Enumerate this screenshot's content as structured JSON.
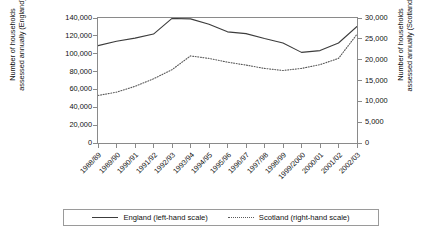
{
  "chart_data": {
    "type": "line",
    "title": "",
    "xlabel": "",
    "categories": [
      "1988/89",
      "1989/90",
      "1990/91",
      "1991/92",
      "1992/93",
      "1993/94",
      "1994/95",
      "1995/96",
      "1996/97",
      "1997/98",
      "1998/99",
      "1999/2000",
      "2000/01",
      "2001/02",
      "2002/03"
    ],
    "grid": false,
    "legend_position": "bottom",
    "axes": {
      "left": {
        "label_line1": "Number of households",
        "label_line2": "assessed annually (England)",
        "ylim": [
          0,
          140000
        ],
        "ticks": [
          0,
          20000,
          40000,
          60000,
          80000,
          100000,
          120000,
          140000
        ],
        "tick_labels": [
          "0",
          "20,000",
          "40,000",
          "60,000",
          "80,000",
          "100,000",
          "120,000",
          "140,000"
        ]
      },
      "right": {
        "label_line1": "Number of households",
        "label_line2": "assessed annually (Scotland)",
        "ylim": [
          0,
          30000
        ],
        "ticks": [
          0,
          5000,
          10000,
          15000,
          20000,
          25000,
          30000
        ],
        "tick_labels": [
          "0",
          "5,000",
          "10,000",
          "15,000",
          "20,000",
          "25,000",
          "30,000"
        ]
      }
    },
    "series": [
      {
        "name": "England (left-hand scale)",
        "axis": "left",
        "style": "solid",
        "color": "#3c3c3c",
        "values": [
          109000,
          114000,
          117500,
          122000,
          139500,
          139000,
          133000,
          124500,
          122500,
          117000,
          112000,
          101500,
          103500,
          112000,
          130500
        ]
      },
      {
        "name": "Scotland (right-hand scale)",
        "axis": "right",
        "style": "dotted",
        "color": "#5a5a5a",
        "values": [
          11400,
          12200,
          13600,
          15400,
          17600,
          20900,
          20300,
          19400,
          18700,
          17900,
          17400,
          17900,
          18800,
          20300,
          26100
        ]
      }
    ]
  },
  "legend": {
    "entries": [
      {
        "label": "England (left-hand scale)",
        "style": "solid"
      },
      {
        "label": "Scotland (right-hand scale)",
        "style": "dotted"
      }
    ]
  }
}
